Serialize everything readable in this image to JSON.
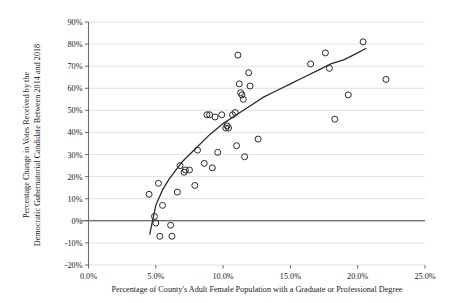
{
  "chart_data": {
    "type": "scatter",
    "title": "",
    "xlabel": "Percentage of County's Adult Female Population with a Graduate or Professional Degree",
    "ylabel_line1": "Percentage Change in Votes Received by the",
    "ylabel_line2": "Democratic Gubernatorial Candidate Between 2014 and 2018",
    "ylabel": "Percentage Change in Votes Received by the Democratic Gubernatorial Candidate Between 2014 and 2018",
    "xlim": [
      0.0,
      25.0
    ],
    "ylim": [
      -20,
      90
    ],
    "xticks": [
      0.0,
      5.0,
      10.0,
      15.0,
      20.0,
      25.0
    ],
    "xtick_labels": [
      "0.0%",
      "5.0%",
      "10.0%",
      "15.0%",
      "20.0%",
      "25.0%"
    ],
    "yticks": [
      -20,
      -10,
      0,
      10,
      20,
      30,
      40,
      50,
      60,
      70,
      80,
      90
    ],
    "ytick_labels": [
      "-20%",
      "-10%",
      "0%",
      "10%",
      "20%",
      "30%",
      "40%",
      "50%",
      "60%",
      "70%",
      "80%",
      "90%"
    ],
    "grid": "horizontal",
    "legend": "none",
    "marker": "open-circle",
    "marker_color": "#2b2b2b",
    "marker_radius_px": 3.0,
    "gridline_color": "#d4d4d4",
    "axis_color": "#6b6b6b",
    "zero_line_value": 0,
    "points": [
      {
        "x": 4.5,
        "y": 12
      },
      {
        "x": 4.9,
        "y": 2
      },
      {
        "x": 5.0,
        "y": -1
      },
      {
        "x": 5.2,
        "y": 17
      },
      {
        "x": 5.3,
        "y": -7
      },
      {
        "x": 5.5,
        "y": 7
      },
      {
        "x": 6.1,
        "y": -2
      },
      {
        "x": 6.2,
        "y": -7
      },
      {
        "x": 6.6,
        "y": 13
      },
      {
        "x": 6.8,
        "y": 25
      },
      {
        "x": 7.1,
        "y": 22
      },
      {
        "x": 7.2,
        "y": 23
      },
      {
        "x": 7.5,
        "y": 23
      },
      {
        "x": 7.9,
        "y": 16
      },
      {
        "x": 8.1,
        "y": 32
      },
      {
        "x": 8.6,
        "y": 26
      },
      {
        "x": 8.8,
        "y": 48
      },
      {
        "x": 9.0,
        "y": 48
      },
      {
        "x": 9.2,
        "y": 24
      },
      {
        "x": 9.4,
        "y": 47
      },
      {
        "x": 9.6,
        "y": 31
      },
      {
        "x": 9.9,
        "y": 48
      },
      {
        "x": 10.2,
        "y": 42
      },
      {
        "x": 10.3,
        "y": 43
      },
      {
        "x": 10.4,
        "y": 42
      },
      {
        "x": 10.7,
        "y": 48
      },
      {
        "x": 10.9,
        "y": 49
      },
      {
        "x": 11.0,
        "y": 34
      },
      {
        "x": 11.1,
        "y": 75
      },
      {
        "x": 11.2,
        "y": 62
      },
      {
        "x": 11.3,
        "y": 58
      },
      {
        "x": 11.4,
        "y": 57
      },
      {
        "x": 11.5,
        "y": 55
      },
      {
        "x": 11.6,
        "y": 29
      },
      {
        "x": 11.9,
        "y": 67
      },
      {
        "x": 12.0,
        "y": 61
      },
      {
        "x": 12.6,
        "y": 37
      },
      {
        "x": 16.5,
        "y": 71
      },
      {
        "x": 17.6,
        "y": 76
      },
      {
        "x": 17.9,
        "y": 69
      },
      {
        "x": 18.3,
        "y": 46
      },
      {
        "x": 19.3,
        "y": 57
      },
      {
        "x": 20.4,
        "y": 81
      },
      {
        "x": 22.1,
        "y": 64
      }
    ],
    "trendline": {
      "type": "logarithmic-fit",
      "visible": true,
      "path_points": [
        {
          "x": 4.55,
          "y": -6
        },
        {
          "x": 5.0,
          "y": 7
        },
        {
          "x": 5.5,
          "y": 14
        },
        {
          "x": 6.0,
          "y": 19
        },
        {
          "x": 7.0,
          "y": 27
        },
        {
          "x": 8.0,
          "y": 33
        },
        {
          "x": 9.0,
          "y": 39
        },
        {
          "x": 10.0,
          "y": 44
        },
        {
          "x": 11.0,
          "y": 48
        },
        {
          "x": 12.0,
          "y": 52
        },
        {
          "x": 13.0,
          "y": 56
        },
        {
          "x": 14.0,
          "y": 59
        },
        {
          "x": 15.0,
          "y": 62
        },
        {
          "x": 16.0,
          "y": 65
        },
        {
          "x": 17.0,
          "y": 68
        },
        {
          "x": 18.0,
          "y": 71
        },
        {
          "x": 19.0,
          "y": 73
        },
        {
          "x": 20.0,
          "y": 76
        },
        {
          "x": 20.6,
          "y": 78
        }
      ]
    }
  }
}
